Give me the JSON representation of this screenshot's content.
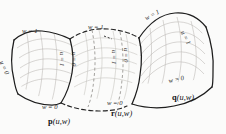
{
  "figure": {
    "kind": "parametric-surface-patch-diagram",
    "background_color": "#fbfbfa",
    "ink_color": "#1d1d1d",
    "grid_color": "#b9b6b2",
    "dashed_color": "#2b2b2b"
  },
  "patches": [
    {
      "id": "p",
      "name_bold": "p",
      "name_args": "(u,w)",
      "boundary_style": "solid",
      "edges": {
        "top": "w = 1",
        "bottom": "w = 0",
        "left": "u = 0",
        "right": "u = 1"
      }
    },
    {
      "id": "r",
      "name_bold": "r",
      "name_args": "(u,w)",
      "boundary_style": "dashed",
      "edges": {
        "top": "w = 1",
        "bottom": "w = 0",
        "left": "u = 0",
        "right": "u = 1"
      }
    },
    {
      "id": "q",
      "name_bold": "q",
      "name_args": "(u,w)",
      "boundary_style": "solid",
      "edges": {
        "top": "w = 1",
        "bottom": "w = 0",
        "left": "u = 0",
        "right": "u = 1"
      }
    }
  ],
  "labels": {
    "p_top_w1": "w = 1",
    "p_left_u0": "u = 0",
    "p_bottom_w0": "w = 0",
    "p_right_u1": "u = 1",
    "r_top_w1": "w = 1",
    "r_left_u0": "u = 0",
    "r_right_u1": "u = 1",
    "r_bottom_w0": "w = 0",
    "q_top_w1": "w = 1",
    "q_left_u0": "u = 0",
    "q_right_u1": "u = 1",
    "q_bottom_w0": "w = 0"
  },
  "captions": {
    "p": "p(u,w)",
    "r": "r(u,w)",
    "q": "q(u,w)"
  }
}
